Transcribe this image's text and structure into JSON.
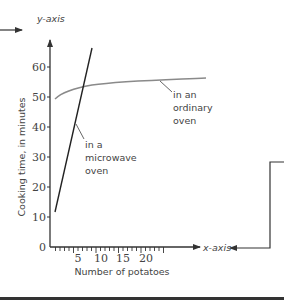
{
  "chart_data": {
    "type": "line",
    "title": "",
    "xlabel": "Number of potatoes",
    "ylabel": "Cooking time, in minutes",
    "x_axis_callout": "x-axis",
    "y_axis_callout": "y-axis",
    "xlim": [
      0,
      25
    ],
    "ylim": [
      0,
      65
    ],
    "x_ticks": [
      "5",
      "10",
      "15",
      "20"
    ],
    "y_ticks": [
      "0",
      "10",
      "20",
      "30",
      "40",
      "50",
      "60"
    ],
    "grid": false,
    "series": [
      {
        "name": "in a microwave oven",
        "label_lines": [
          "in a",
          "microwave",
          "oven"
        ],
        "color": "#222222",
        "x": [
          1,
          2,
          3,
          4,
          5,
          6,
          7,
          8
        ],
        "y": [
          12,
          20,
          28,
          35,
          42,
          49,
          57,
          65
        ]
      },
      {
        "name": "in an ordinary oven",
        "label_lines": [
          "in an",
          "ordinary",
          "oven"
        ],
        "color": "#8a8a8a",
        "x": [
          1,
          3,
          5,
          8,
          10,
          15,
          20,
          25
        ],
        "y": [
          50,
          52.5,
          53.5,
          54.5,
          55,
          55.5,
          56,
          56.5
        ]
      }
    ]
  }
}
